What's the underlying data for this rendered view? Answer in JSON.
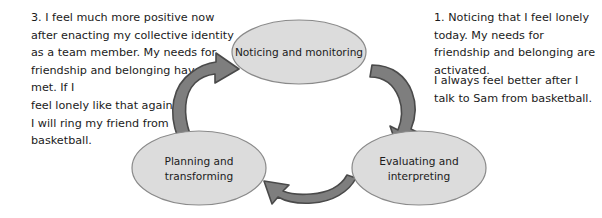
{
  "diagram": {
    "colors": {
      "ellipse_fill": "#dcdcdc",
      "ellipse_stroke": "#8a8a8a",
      "arrow_fill": "#7e7e7e",
      "arrow_stroke": "#4a4a4a",
      "text": "#1b1b1b",
      "background": "#ffffff"
    },
    "nodes": [
      {
        "id": "noticing",
        "lines": [
          "Noticing and monitoring"
        ],
        "cx": 299,
        "cy": 52,
        "rx": 67,
        "ry": 32
      },
      {
        "id": "evaluating",
        "lines": [
          "Evaluating and",
          "interpreting"
        ],
        "cx": 419,
        "cy": 168,
        "rx": 67,
        "ry": 37
      },
      {
        "id": "planning",
        "lines": [
          "Planning and",
          "transforming"
        ],
        "cx": 199,
        "cy": 168,
        "rx": 67,
        "ry": 37
      }
    ],
    "arrows": [
      {
        "id": "planning-to-noticing",
        "from": "planning",
        "to": "noticing"
      },
      {
        "id": "noticing-to-evaluating",
        "from": "noticing",
        "to": "evaluating"
      },
      {
        "id": "evaluating-to-planning",
        "from": "evaluating",
        "to": "planning"
      }
    ]
  },
  "notes": {
    "left": "3. I feel much more positive now after enacting my collective identity as a team member. My needs for friendship and belonging have been met. If I\nfeel lonely like that again,\nI will ring my friend from\nbasketball.",
    "right_first": "1. Noticing that I feel lonely today. My needs for friendship and belonging are activated.",
    "right_second": "I always feel better after I talk to Sam from basketball."
  }
}
